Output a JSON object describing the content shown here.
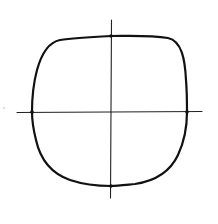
{
  "diagram": {
    "title": "Hand-drawn squircle (superellipse) on cross axes",
    "background": "#ffffff",
    "stroke_color": "#111111",
    "axes": {
      "horizontal": {
        "x1": 17,
        "y1": 112,
        "x2": 202,
        "y2": 112
      },
      "vertical": {
        "x1": 111,
        "y1": 20,
        "x2": 111,
        "y2": 198
      },
      "stroke_width": 1.1
    },
    "shape": {
      "type": "squircle",
      "center": [
        111,
        112
      ],
      "extents": {
        "left": 32,
        "right": 187,
        "top": 36,
        "bottom": 186
      },
      "stroke_width": 2.2
    },
    "intersection_marks": [
      {
        "name": "top",
        "x": 111,
        "y": 36
      },
      {
        "name": "bottom",
        "x": 111,
        "y": 186
      },
      {
        "name": "left",
        "x": 32,
        "y": 112
      },
      {
        "name": "right",
        "x": 187,
        "y": 112
      }
    ]
  }
}
